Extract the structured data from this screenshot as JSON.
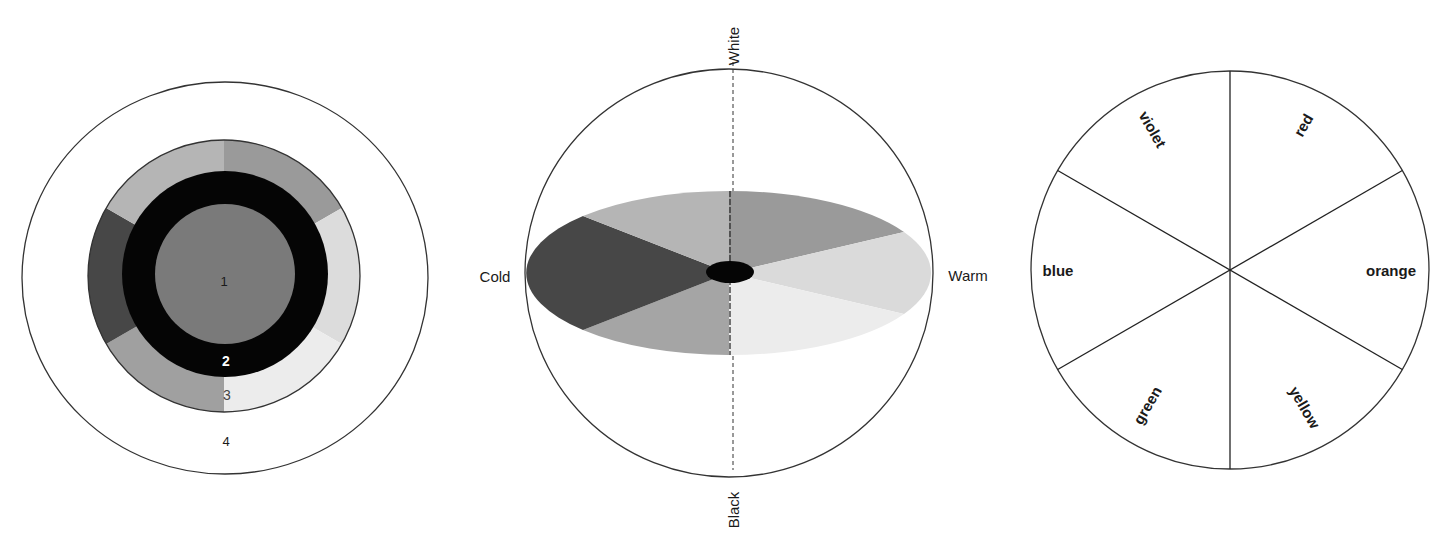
{
  "figures": {
    "concentric": {
      "labels": {
        "inner_disc": "1",
        "black_ring": "2",
        "color_ring": "3",
        "surround": "4"
      },
      "colors": {
        "inner_disc": "#7a7a7a",
        "black_ring": "#050505",
        "segments": [
          "#9a9a9a",
          "#dcdcdc",
          "#ececec",
          "#a0a0a0",
          "#474747",
          "#b5b5b5"
        ],
        "outline": "#333333"
      }
    },
    "sphere": {
      "labels": {
        "top": "White",
        "bottom": "Black",
        "left": "Cold",
        "right": "Warm"
      },
      "colors": {
        "segments": [
          "#9a9a9a",
          "#dadada",
          "#ececec",
          "#a5a5a5",
          "#474747",
          "#b5b5b5"
        ],
        "center": "#050505",
        "outline": "#333333"
      }
    },
    "hue_wheel": {
      "segments": [
        {
          "label": "red"
        },
        {
          "label": "orange"
        },
        {
          "label": "yellow"
        },
        {
          "label": "green"
        },
        {
          "label": "blue"
        },
        {
          "label": "violet"
        }
      ]
    }
  }
}
